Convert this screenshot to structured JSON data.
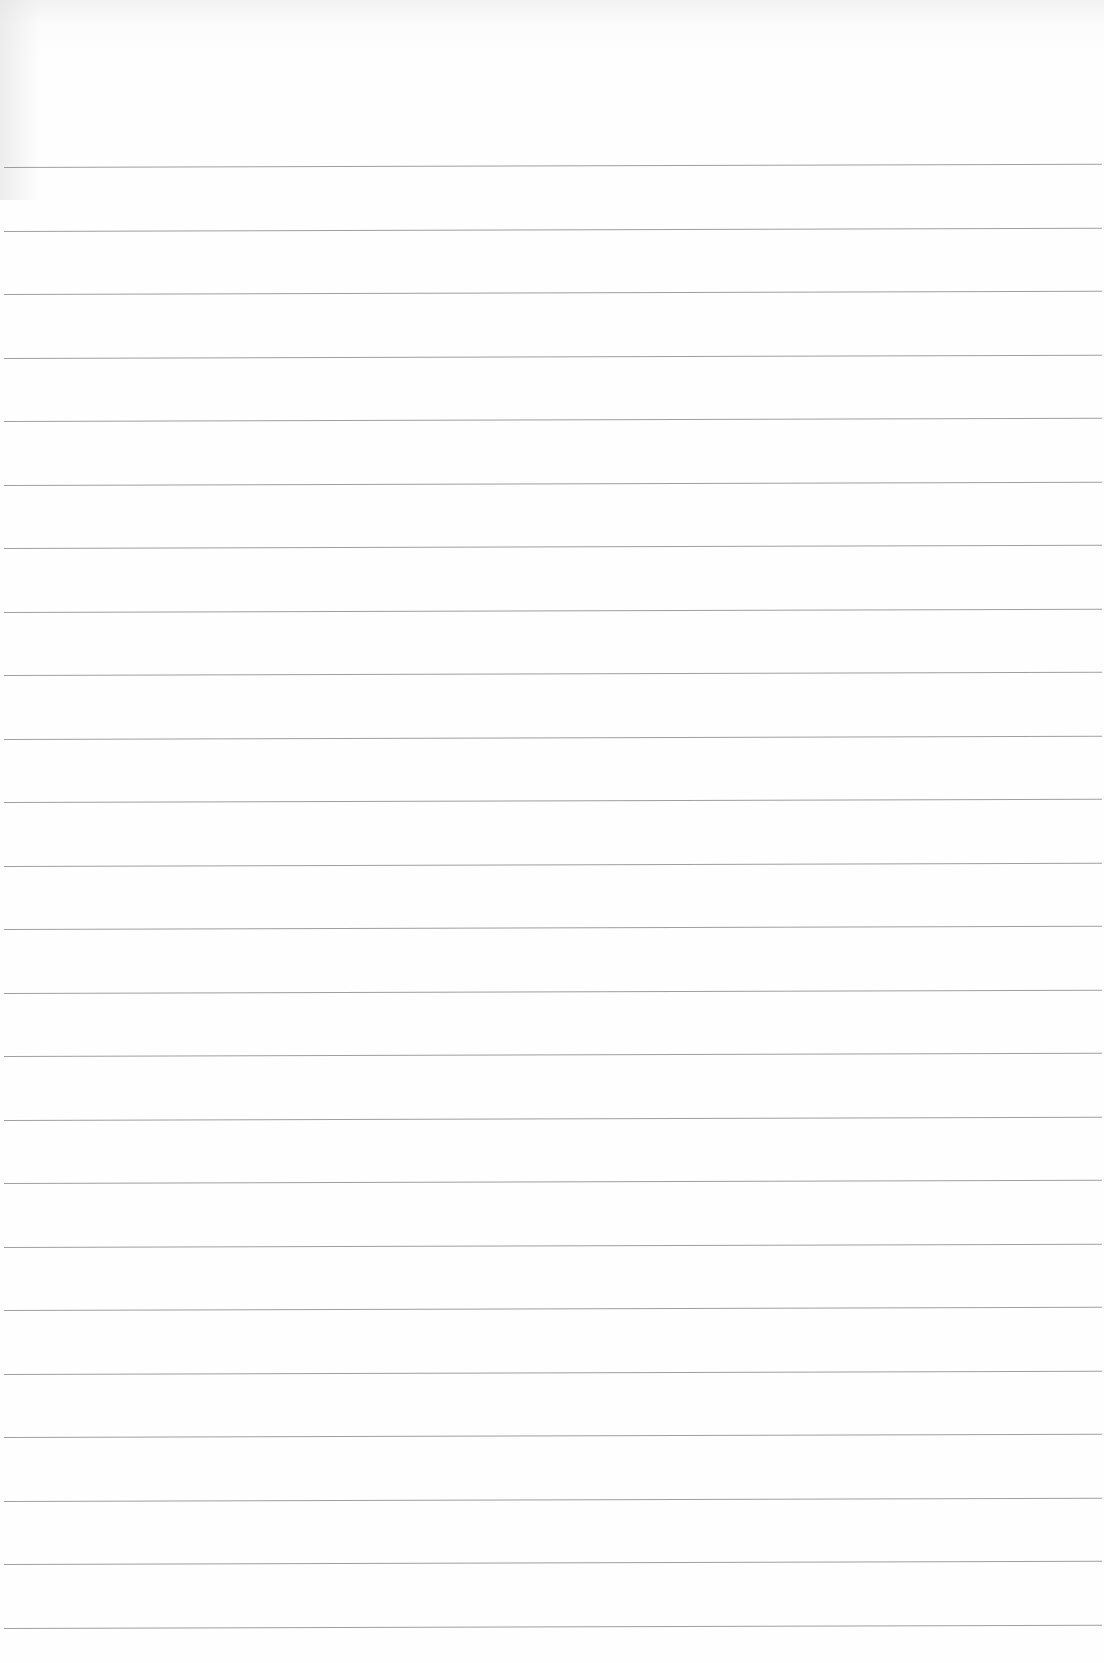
{
  "sheet": {
    "type": "ruled-paper",
    "line_color": "#8e8e8e",
    "background_color": "#fdfdfd",
    "line_count": 24,
    "first_line_y": 167,
    "line_spacing_px": 63.5
  }
}
